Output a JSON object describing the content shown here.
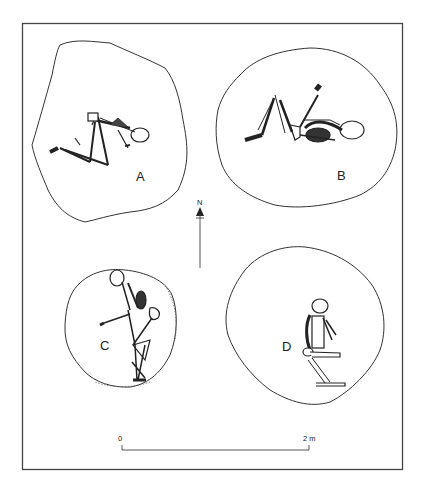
{
  "figure": {
    "type": "archaeological burial plan",
    "burials": [
      {
        "id": "A",
        "label": "A",
        "position": "flexed, lying on side, head east"
      },
      {
        "id": "B",
        "label": "B",
        "position": "supine, legs flexed upward, head east"
      },
      {
        "id": "C",
        "label": "C",
        "position": "seated/crouched, head north"
      },
      {
        "id": "D",
        "label": "D",
        "position": "seated, knees drawn, head north"
      }
    ],
    "north_arrow": {
      "label": "N"
    },
    "scale_bar": {
      "start_label": "0",
      "end_label": "2 m"
    },
    "colors": {
      "line": "#333333",
      "background": "#ffffff"
    }
  }
}
